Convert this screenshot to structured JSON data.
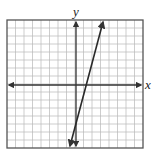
{
  "chart_data": {
    "type": "line",
    "title": "",
    "xlabel": "x",
    "ylabel": "y",
    "xlim": [
      -8,
      8
    ],
    "ylim": [
      -8,
      8
    ],
    "grid": true,
    "grid_cells": 16,
    "tick_labels": false,
    "series": [
      {
        "name": "line",
        "equation": "y = 4x - 4",
        "x": [
          -0.8,
          0,
          1,
          2,
          2.85
        ],
        "y": [
          -7.2,
          -4,
          0,
          4,
          7.4
        ],
        "arrows_both_ends": true
      }
    ],
    "colors": {
      "grid": "#b8b8b8",
      "border": "#555555",
      "axes": "#333333",
      "line": "#2a2a2a"
    }
  },
  "labels": {
    "x_axis": "x",
    "y_axis": "y"
  }
}
